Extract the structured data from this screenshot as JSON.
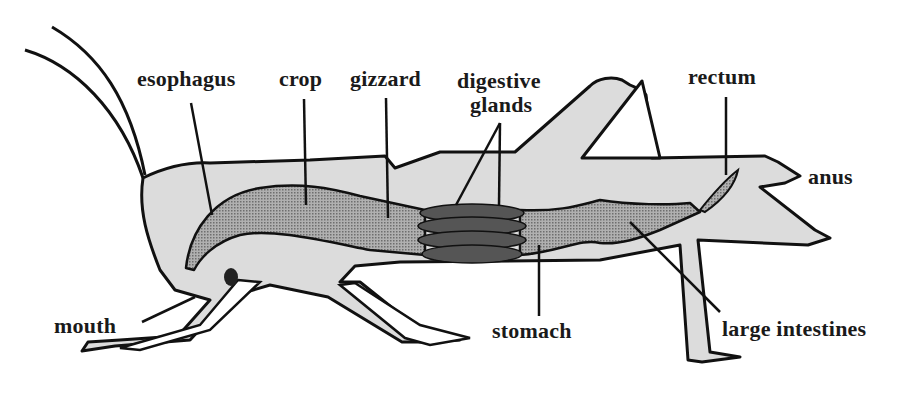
{
  "diagram": {
    "colors": {
      "body_fill": "#dcdcdc",
      "outline": "#111111",
      "gut_fill": "#9a9a9a",
      "glands_fill": "#555555",
      "background": "#ffffff"
    },
    "labels": {
      "esophagus": "esophagus",
      "crop": "crop",
      "gizzard": "gizzard",
      "digestive_glands_line1": "digestive",
      "digestive_glands_line2": "glands",
      "rectum": "rectum",
      "anus": "anus",
      "mouth": "mouth",
      "stomach": "stomach",
      "large_intestines": "large intestines"
    }
  }
}
